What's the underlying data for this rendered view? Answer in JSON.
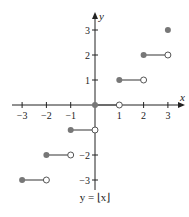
{
  "chart_data": {
    "type": "line",
    "title": "",
    "caption": "y = ⌊x⌋",
    "xlabel": "x",
    "ylabel": "y",
    "xlim": [
      -3,
      3
    ],
    "ylim": [
      -3,
      3
    ],
    "x_ticks": [
      -3,
      -2,
      -1,
      1,
      2,
      3
    ],
    "x_tick_labels": [
      "−3",
      "−2",
      "−1",
      "1",
      "2",
      "3"
    ],
    "y_ticks": [
      -3,
      -2,
      1,
      2,
      3
    ],
    "y_tick_labels": [
      "−3",
      "−2",
      "1",
      "2",
      "3"
    ],
    "grid": false,
    "segments": [
      {
        "x_start": -3,
        "x_end": -2,
        "y": -3,
        "start_closed": true,
        "end_closed": false
      },
      {
        "x_start": -2,
        "x_end": -1,
        "y": -2,
        "start_closed": true,
        "end_closed": false
      },
      {
        "x_start": -1,
        "x_end": 0,
        "y": -1,
        "start_closed": true,
        "end_closed": false
      },
      {
        "x_start": 0,
        "x_end": 1,
        "y": 0,
        "start_closed": true,
        "end_closed": false
      },
      {
        "x_start": 1,
        "x_end": 2,
        "y": 1,
        "start_closed": true,
        "end_closed": false
      },
      {
        "x_start": 2,
        "x_end": 3,
        "y": 2,
        "start_closed": true,
        "end_closed": false
      },
      {
        "x_start": 3,
        "x_end": 3,
        "y": 3,
        "start_closed": true,
        "end_closed": true
      }
    ],
    "colors": {
      "axis": "#222222",
      "step": "#555555",
      "closed_dot": "#777777",
      "open_dot_fill": "#ffffff"
    }
  }
}
